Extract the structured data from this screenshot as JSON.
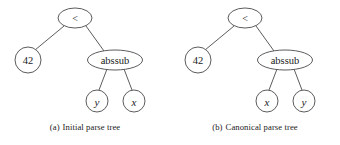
{
  "figure": {
    "width": 340,
    "height": 145,
    "background": "#ffffff",
    "stroke_color": "#4a4a4a",
    "text_color": "#1a1a1a"
  },
  "subfigures": [
    {
      "id": "a",
      "tag": "(a)",
      "caption": "Initial parse tree",
      "origin_x": 0,
      "nodes": {
        "root": {
          "label": "<",
          "kind": "operator",
          "shape": "ellipse",
          "cx": 75,
          "cy": 18,
          "rx": 17,
          "ry": 10
        },
        "left_child": {
          "label": "42",
          "kind": "number",
          "shape": "circle",
          "cx": 28,
          "cy": 60,
          "r": 13
        },
        "right_child": {
          "label": "abssub",
          "kind": "word",
          "shape": "ellipse",
          "cx": 115,
          "cy": 60,
          "rx": 27.5,
          "ry": 10
        },
        "leaf_left": {
          "label": "y",
          "kind": "variable",
          "shape": "circle",
          "cx": 97,
          "cy": 101,
          "r": 11
        },
        "leaf_right": {
          "label": "x",
          "kind": "variable",
          "shape": "circle",
          "cx": 134,
          "cy": 101,
          "r": 11
        }
      }
    },
    {
      "id": "b",
      "tag": "(b)",
      "caption": "Canonical parse tree",
      "origin_x": 170,
      "nodes": {
        "root": {
          "label": "<",
          "kind": "operator",
          "shape": "ellipse",
          "cx": 245,
          "cy": 18,
          "rx": 17,
          "ry": 10
        },
        "left_child": {
          "label": "42",
          "kind": "number",
          "shape": "circle",
          "cx": 198,
          "cy": 60,
          "r": 13
        },
        "right_child": {
          "label": "abssub",
          "kind": "word",
          "shape": "ellipse",
          "cx": 285,
          "cy": 60,
          "rx": 27.5,
          "ry": 10
        },
        "leaf_left": {
          "label": "x",
          "kind": "variable",
          "shape": "circle",
          "cx": 267,
          "cy": 101,
          "r": 11
        },
        "leaf_right": {
          "label": "y",
          "kind": "variable",
          "shape": "circle",
          "cx": 304,
          "cy": 101,
          "r": 11
        }
      }
    }
  ]
}
